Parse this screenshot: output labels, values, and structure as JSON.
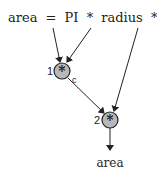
{
  "diagram": {
    "expression": "area = PI * radius * radius",
    "tokens": {
      "lhs": "area",
      "eq": "=",
      "pi": "PI",
      "op1": "*",
      "radius1": "radius",
      "op2": "*",
      "radius2": "radius"
    },
    "nodes": [
      {
        "id": "1",
        "label": "1",
        "operator": "*",
        "annotation": "c"
      },
      {
        "id": "2",
        "label": "2",
        "operator": "*",
        "annotation": ""
      }
    ],
    "output": "area",
    "edges": [
      {
        "from": "PI",
        "to": "1"
      },
      {
        "from": "radius",
        "to": "1"
      },
      {
        "from": "radius",
        "to": "2"
      },
      {
        "from": "1",
        "to": "2"
      },
      {
        "from": "2",
        "to": "area"
      }
    ],
    "colors": {
      "node_fill": "#b8b8b8",
      "stroke": "#222222",
      "background": "#ffffff"
    }
  }
}
